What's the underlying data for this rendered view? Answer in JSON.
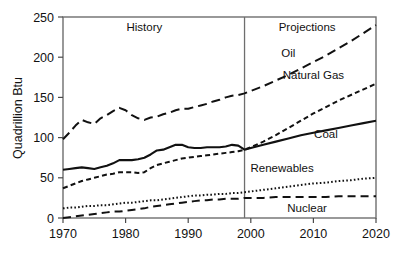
{
  "chart_data": {
    "type": "line",
    "title": "",
    "xlabel": "",
    "ylabel": "Quadrillion Btu",
    "xlim": [
      1970,
      2020
    ],
    "ylim": [
      0,
      250
    ],
    "grid": false,
    "legend_position": "inline-labels",
    "x_ticks": [
      "1970",
      "1980",
      "1990",
      "2000",
      "2010",
      "2020"
    ],
    "x_tick_values": [
      1970,
      1980,
      1990,
      2000,
      2010,
      2020
    ],
    "y_ticks": [
      "0",
      "50",
      "100",
      "150",
      "200",
      "250"
    ],
    "y_tick_values": [
      0,
      50,
      100,
      150,
      200,
      250
    ],
    "annotations": [
      {
        "text": "History",
        "x": 1983,
        "y": 238
      },
      {
        "text": "Projections",
        "x": 2009,
        "y": 238
      }
    ],
    "divider_x": 1999,
    "x": [
      1970,
      1971,
      1972,
      1973,
      1974,
      1975,
      1976,
      1977,
      1978,
      1979,
      1980,
      1981,
      1982,
      1983,
      1984,
      1985,
      1986,
      1987,
      1988,
      1989,
      1990,
      1991,
      1992,
      1993,
      1994,
      1995,
      1996,
      1997,
      1998,
      1999,
      2000,
      2002,
      2004,
      2006,
      2008,
      2010,
      2012,
      2014,
      2016,
      2018,
      2020
    ],
    "series": [
      {
        "name": "Oil",
        "style": "long-dash",
        "label_x": 2006,
        "label_y": 205,
        "values": [
          98,
          106,
          115,
          122,
          119,
          117,
          124,
          128,
          133,
          137,
          134,
          128,
          124,
          122,
          125,
          126,
          129,
          131,
          134,
          136,
          136,
          138,
          140,
          142,
          145,
          147,
          150,
          152,
          153,
          155,
          158,
          164,
          171,
          178,
          186,
          194,
          202,
          211,
          220,
          230,
          240
        ]
      },
      {
        "name": "Natural Gas",
        "style": "short-dash",
        "label_x": 2010,
        "label_y": 178,
        "values": [
          37,
          40,
          43,
          46,
          48,
          50,
          52,
          54,
          55,
          57,
          57,
          57,
          56,
          57,
          62,
          66,
          68,
          70,
          72,
          74,
          75,
          76,
          77,
          78,
          79,
          80,
          81,
          82,
          83,
          85,
          88,
          95,
          103,
          112,
          121,
          130,
          138,
          146,
          153,
          160,
          167
        ]
      },
      {
        "name": "Coal",
        "style": "solid",
        "label_x": 2012,
        "label_y": 105,
        "values": [
          60,
          61,
          62,
          63,
          62,
          61,
          63,
          65,
          68,
          72,
          72,
          72,
          73,
          75,
          79,
          84,
          85,
          88,
          91,
          91,
          88,
          87,
          87,
          88,
          88,
          88,
          89,
          91,
          90,
          85,
          87,
          91,
          95,
          99,
          103,
          106,
          109,
          112,
          115,
          118,
          121
        ]
      },
      {
        "name": "Renewables",
        "style": "dotted",
        "label_x": 2005,
        "label_y": 62,
        "values": [
          12,
          13,
          13,
          14,
          15,
          15,
          16,
          16,
          17,
          18,
          19,
          19,
          20,
          21,
          22,
          22,
          23,
          24,
          25,
          26,
          27,
          28,
          28,
          29,
          29,
          30,
          30,
          31,
          31,
          32,
          33,
          35,
          37,
          39,
          41,
          43,
          44,
          46,
          47,
          49,
          50
        ]
      },
      {
        "name": "Nuclear",
        "style": "dash",
        "label_x": 2009,
        "label_y": 12,
        "values": [
          0,
          1,
          2,
          3,
          4,
          5,
          6,
          7,
          8,
          8,
          9,
          10,
          11,
          12,
          14,
          15,
          16,
          17,
          18,
          19,
          20,
          21,
          22,
          22,
          23,
          23,
          24,
          24,
          24,
          25,
          25,
          25,
          26,
          26,
          26,
          26,
          26,
          27,
          27,
          27,
          27
        ]
      }
    ]
  },
  "figure": {
    "y_axis_title": "Quadrillion Btu"
  }
}
